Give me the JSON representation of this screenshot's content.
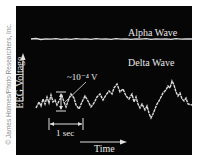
{
  "credit": "© James Holmes/Photo Researchers, Inc.",
  "labels": {
    "alpha": "Alpha Wave",
    "delta": "Delta Wave",
    "y_axis": "EEG Voltage",
    "x_axis": "Time",
    "amplitude": "~10⁻⁴ V",
    "scale": "1 sec"
  },
  "colors": {
    "background": "#060606",
    "trace": "#e0e0e0"
  }
}
